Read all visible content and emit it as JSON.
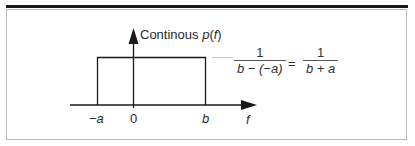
{
  "diagram": {
    "title_label": {
      "prefix": "Continous ",
      "func": "p",
      "open": "(",
      "var": "f",
      "close": ")"
    },
    "x_axis_label": "f",
    "tick_labels": {
      "neg_a": "−a",
      "zero": "0",
      "b": "b"
    },
    "equation": {
      "lhs_numerator": "1",
      "lhs_denominator": "b − (−a)",
      "equals": "=",
      "rhs_numerator": "1",
      "rhs_denominator": "b + a"
    },
    "colors": {
      "ink": "#1a1a1a",
      "frame": "#b9b9b9"
    }
  }
}
